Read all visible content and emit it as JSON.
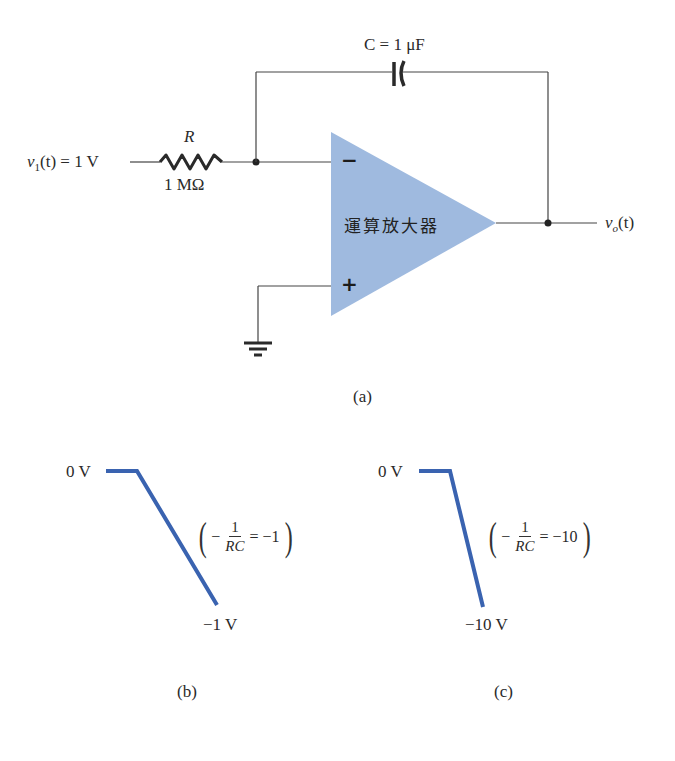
{
  "circuit": {
    "input_label": {
      "var": "v",
      "sub": "1",
      "rest": "(t) = 1 V"
    },
    "resistor": {
      "name": "R",
      "value": "1 MΩ"
    },
    "capacitor": {
      "label": "C = 1 μF"
    },
    "opamp": {
      "label": "運算放大器",
      "minus": "−",
      "plus": "+",
      "fill": "#9fbadf"
    },
    "output_label": {
      "var": "v",
      "sub": "o",
      "rest": "(t)"
    },
    "caption": "(a)"
  },
  "graphs": [
    {
      "id": "b",
      "top_label": "0 V",
      "bottom_label": "−1 V",
      "slope_expr": {
        "lhs_num": "1",
        "lhs_den": "RC",
        "prefix": "−",
        "rhs": "= −1"
      },
      "caption": "(b)",
      "line_color": "#3a63b0"
    },
    {
      "id": "c",
      "top_label": "0 V",
      "bottom_label": "−10 V",
      "slope_expr": {
        "lhs_num": "1",
        "lhs_den": "RC",
        "prefix": "−",
        "rhs": "= −10"
      },
      "caption": "(c)",
      "line_color": "#3a63b0"
    }
  ]
}
